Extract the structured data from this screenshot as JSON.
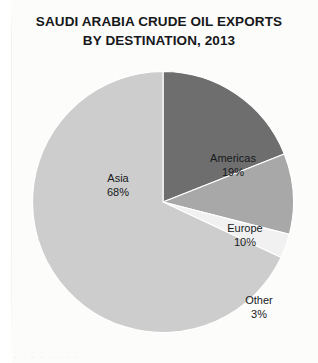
{
  "chart_data": {
    "type": "pie",
    "title": "SAUDI ARABIA CRUDE OIL EXPORTS BY DESTINATION, 2013",
    "title_lines": [
      "SAUDI ARABIA CRUDE OIL EXPORTS",
      "BY DESTINATION, 2013"
    ],
    "categories": [
      "Americas",
      "Europe",
      "Other",
      "Asia"
    ],
    "values": [
      19,
      10,
      3,
      68
    ],
    "value_suffix": "%",
    "units": "percent of total crude oil exports",
    "start_angle_deg": 0,
    "direction": "clockwise",
    "legend": "none",
    "labels_inside": true,
    "slices": [
      {
        "name": "Americas",
        "value": 19,
        "value_label": "19%",
        "color": "#6e6e6e",
        "label_position": "inside"
      },
      {
        "name": "Europe",
        "value": 10,
        "value_label": "10%",
        "color": "#a8a8a8",
        "label_position": "inside"
      },
      {
        "name": "Other",
        "value": 3,
        "value_label": "3%",
        "color": "#f1f1f1",
        "label_position": "outside"
      },
      {
        "name": "Asia",
        "value": 68,
        "value_label": "68%",
        "color": "#cdcdcd",
        "label_position": "inside"
      }
    ],
    "xlabel": "",
    "ylabel": "",
    "grid": false
  },
  "colors": {
    "background": "#fcfcfb",
    "title_text": "#16181a",
    "label_text": "#17191b",
    "slice_americas": "#6e6e6e",
    "slice_europe": "#a8a8a8",
    "slice_other": "#f1f1f1",
    "slice_asia": "#cdcdcd",
    "slice_outline": "#ffffff"
  },
  "footer": {
    "scan_remnant": "·  ·   ·    ·  ·  ·   ·  ·"
  }
}
